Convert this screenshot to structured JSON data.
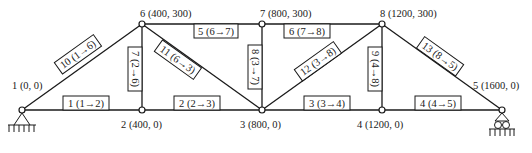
{
  "diagram": {
    "type": "plane-truss",
    "colors": {
      "line": "#1a1a1a",
      "background": "#ffffff"
    },
    "nodes": [
      {
        "id": "1",
        "label": "1 (0, 0)",
        "coord": [
          0,
          0
        ]
      },
      {
        "id": "2",
        "label": "2 (400, 0)",
        "coord": [
          400,
          0
        ]
      },
      {
        "id": "3",
        "label": "3 (800, 0)",
        "coord": [
          800,
          0
        ]
      },
      {
        "id": "4",
        "label": "4 (1200, 0)",
        "coord": [
          1200,
          0
        ]
      },
      {
        "id": "5",
        "label": "5 (1600, 0)",
        "coord": [
          1600,
          0
        ]
      },
      {
        "id": "6",
        "label": "6 (400, 300)",
        "coord": [
          400,
          300
        ]
      },
      {
        "id": "7",
        "label": "7 (800, 300)",
        "coord": [
          800,
          300
        ]
      },
      {
        "id": "8",
        "label": "8 (1200, 300)",
        "coord": [
          1200,
          300
        ]
      }
    ],
    "members": [
      {
        "id": "1",
        "label": "1 (1→2)",
        "from": "1",
        "to": "2"
      },
      {
        "id": "2",
        "label": "2 (2→3)",
        "from": "2",
        "to": "3"
      },
      {
        "id": "3",
        "label": "3 (3→4)",
        "from": "3",
        "to": "4"
      },
      {
        "id": "4",
        "label": "4 (4→5)",
        "from": "4",
        "to": "5"
      },
      {
        "id": "5",
        "label": "5 (6→7)",
        "from": "6",
        "to": "7"
      },
      {
        "id": "6",
        "label": "6 (7→8)",
        "from": "7",
        "to": "8"
      },
      {
        "id": "7",
        "label": "7 (2→6)",
        "from": "2",
        "to": "6"
      },
      {
        "id": "8",
        "label": "8 (3→7)",
        "from": "3",
        "to": "7"
      },
      {
        "id": "9",
        "label": "9 (4→8)",
        "from": "4",
        "to": "8"
      },
      {
        "id": "10",
        "label": "10 (1→6)",
        "from": "1",
        "to": "6"
      },
      {
        "id": "11",
        "label": "11 (6→3)",
        "from": "6",
        "to": "3"
      },
      {
        "id": "12",
        "label": "12 (3→8)",
        "from": "3",
        "to": "8"
      },
      {
        "id": "13",
        "label": "13 (8→5)",
        "from": "8",
        "to": "5"
      }
    ],
    "supports": [
      {
        "node": "1",
        "type": "pin",
        "label": "pin-support"
      },
      {
        "node": "5",
        "type": "roller",
        "label": "roller-support"
      }
    ]
  }
}
